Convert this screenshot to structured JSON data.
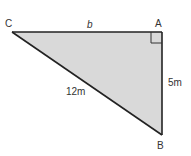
{
  "diagram": {
    "type": "right-triangle",
    "vertices": {
      "C": {
        "label": "C"
      },
      "A": {
        "label": "A"
      },
      "B": {
        "label": "B"
      }
    },
    "sides": {
      "CA": {
        "label": "b"
      },
      "AB": {
        "label": "5m"
      },
      "CB": {
        "label": "12m"
      }
    },
    "right_angle_at": "A",
    "colors": {
      "fill": "#d9d9d9",
      "stroke": "#222222",
      "text": "#333333"
    }
  }
}
